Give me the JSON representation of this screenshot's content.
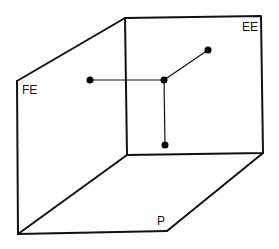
{
  "diagram": {
    "type": "3d-box-projection",
    "labels": {
      "front_face": "FE",
      "back_face": "EE",
      "floor": "P"
    },
    "colors": {
      "line": "#111111",
      "dot": "#000000",
      "background": "#ffffff"
    },
    "vertices": {
      "back_top_left": [
        125,
        18
      ],
      "back_top_right": [
        261,
        16
      ],
      "back_bottom_left": [
        127,
        155
      ],
      "back_bottom_right": [
        263,
        153
      ],
      "front_top_left": [
        17,
        81
      ],
      "front_bottom_left": [
        18,
        234
      ],
      "front_bottom_right": [
        167,
        231
      ]
    },
    "points": [
      {
        "name": "center-point",
        "x": 164,
        "y": 80
      },
      {
        "name": "fe-projection-point",
        "x": 90,
        "y": 80
      },
      {
        "name": "ee-projection-point",
        "x": 208,
        "y": 50
      },
      {
        "name": "p-projection-point",
        "x": 165,
        "y": 145
      }
    ]
  }
}
